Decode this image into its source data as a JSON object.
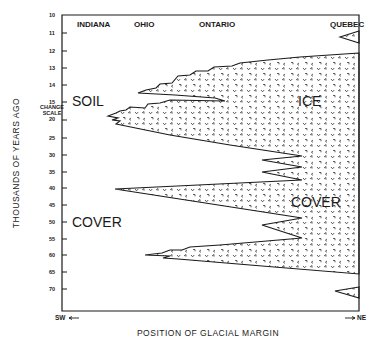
{
  "diagram": {
    "y_axis_title": "THOUSANDS OF YEARS AGO",
    "x_axis_title": "POSITION OF GLACIAL MARGIN",
    "x_direction_left": "SW",
    "x_direction_right": "NE",
    "scale_change_note": [
      "CHANGE",
      "SCALE"
    ],
    "y_ticks": [
      "10",
      "11",
      "12",
      "13",
      "14",
      "15",
      "20",
      "25",
      "30",
      "35",
      "40",
      "45",
      "50",
      "55",
      "60",
      "65",
      "70"
    ],
    "regions": [
      "INDIANA",
      "OHIO",
      "ONTARIO",
      "QUEBEC"
    ],
    "area_labels": {
      "soil": "SOIL",
      "soil_cover": "COVER",
      "ice": "ICE",
      "ice_cover": "COVER"
    },
    "colors": {
      "line": "#1a1a1a",
      "background": "#ffffff"
    }
  }
}
